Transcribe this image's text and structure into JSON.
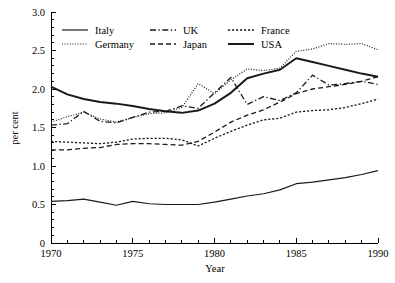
{
  "chart_data": {
    "type": "line",
    "title": "",
    "xlabel": "Year",
    "ylabel": "per cent",
    "xlim": [
      1970,
      1990
    ],
    "ylim": [
      0,
      3.0
    ],
    "grid": false,
    "legend_position": "top-inside",
    "x_ticks_major": [
      1970,
      1975,
      1980,
      1985,
      1990
    ],
    "x_tick_labels": [
      "1970",
      "1975",
      "1980",
      "1985",
      "1990"
    ],
    "x_ticks_minor_step": 1,
    "y_ticks": [
      0,
      0.5,
      1.0,
      1.5,
      2.0,
      2.5,
      3.0
    ],
    "y_tick_labels": [
      "0",
      "0.5",
      "1.0",
      "1.5",
      "2.0",
      "2.5",
      "3.0"
    ],
    "x": [
      1970,
      1971,
      1972,
      1973,
      1974,
      1975,
      1976,
      1977,
      1978,
      1979,
      1980,
      1981,
      1982,
      1983,
      1984,
      1985,
      1986,
      1987,
      1988,
      1989,
      1990
    ],
    "series": [
      {
        "name": "Italy",
        "style": "solid-thin",
        "values": [
          0.54,
          0.55,
          0.57,
          0.53,
          0.49,
          0.54,
          0.51,
          0.5,
          0.5,
          0.5,
          0.53,
          0.57,
          0.61,
          0.64,
          0.69,
          0.77,
          0.79,
          0.82,
          0.85,
          0.89,
          0.94
        ]
      },
      {
        "name": "Germany",
        "style": "dotted",
        "values": [
          1.57,
          1.64,
          1.7,
          1.61,
          1.57,
          1.63,
          1.68,
          1.69,
          1.76,
          2.07,
          1.94,
          2.12,
          2.26,
          2.24,
          2.27,
          2.49,
          2.52,
          2.59,
          2.58,
          2.59,
          2.51
        ]
      },
      {
        "name": "UK",
        "style": "dash-dot",
        "values": [
          1.53,
          1.55,
          1.71,
          1.58,
          1.56,
          1.63,
          1.7,
          1.71,
          1.78,
          1.75,
          1.95,
          2.15,
          1.8,
          1.9,
          1.85,
          1.95,
          2.18,
          2.05,
          2.07,
          2.1,
          2.06
        ]
      },
      {
        "name": "Japan",
        "style": "dashed",
        "values": [
          1.21,
          1.21,
          1.23,
          1.24,
          1.28,
          1.29,
          1.29,
          1.28,
          1.27,
          1.32,
          1.44,
          1.57,
          1.66,
          1.73,
          1.83,
          1.94,
          2.0,
          2.03,
          2.06,
          2.1,
          2.16
        ]
      },
      {
        "name": "France",
        "style": "fine-dash",
        "values": [
          1.32,
          1.31,
          1.3,
          1.29,
          1.31,
          1.35,
          1.36,
          1.36,
          1.34,
          1.26,
          1.36,
          1.45,
          1.53,
          1.6,
          1.62,
          1.7,
          1.72,
          1.73,
          1.76,
          1.81,
          1.87
        ]
      },
      {
        "name": "USA",
        "style": "solid-thick",
        "values": [
          2.03,
          1.93,
          1.87,
          1.83,
          1.81,
          1.78,
          1.74,
          1.71,
          1.69,
          1.72,
          1.81,
          1.95,
          2.14,
          2.2,
          2.25,
          2.4,
          2.35,
          2.3,
          2.25,
          2.2,
          2.16
        ]
      }
    ]
  },
  "legend": {
    "entries": [
      {
        "label": "Italy",
        "style": "solid-thin"
      },
      {
        "label": "UK",
        "style": "dash-dot"
      },
      {
        "label": "France",
        "style": "fine-dash"
      },
      {
        "label": "Germany",
        "style": "dotted"
      },
      {
        "label": "Japan",
        "style": "dashed"
      },
      {
        "label": "USA",
        "style": "solid-thick"
      }
    ]
  },
  "colors": {
    "ink": "#1a1a1a",
    "axis": "#000000",
    "background": "#ffffff"
  }
}
